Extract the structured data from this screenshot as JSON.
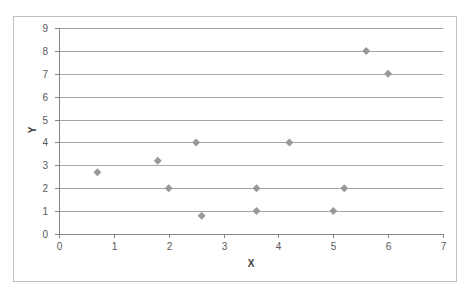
{
  "chart_data": {
    "type": "scatter",
    "title": "",
    "xlabel": "X",
    "ylabel": "Y",
    "xlim": [
      0,
      7
    ],
    "ylim": [
      0,
      9
    ],
    "x_ticks": [
      "0",
      "1",
      "2",
      "3",
      "4",
      "5",
      "6",
      "7"
    ],
    "y_ticks": [
      "0",
      "1",
      "2",
      "3",
      "4",
      "5",
      "6",
      "7",
      "8",
      "9"
    ],
    "grid": "horizontal",
    "legend": "none",
    "marker": "diamond",
    "marker_color": "#999999",
    "series": [
      {
        "name": "Y",
        "points": [
          {
            "x": 0.7,
            "y": 2.7
          },
          {
            "x": 1.8,
            "y": 3.2
          },
          {
            "x": 2.0,
            "y": 2.0
          },
          {
            "x": 2.5,
            "y": 4.0
          },
          {
            "x": 2.6,
            "y": 0.8
          },
          {
            "x": 3.6,
            "y": 2.0
          },
          {
            "x": 3.6,
            "y": 1.0
          },
          {
            "x": 4.2,
            "y": 4.0
          },
          {
            "x": 5.0,
            "y": 1.0
          },
          {
            "x": 5.2,
            "y": 2.0
          },
          {
            "x": 5.6,
            "y": 8.0
          },
          {
            "x": 6.0,
            "y": 7.0
          }
        ]
      }
    ]
  },
  "colors": {
    "gridline": "#a6a6a6",
    "frame": "#bfbfbf",
    "axis": "#868686"
  }
}
